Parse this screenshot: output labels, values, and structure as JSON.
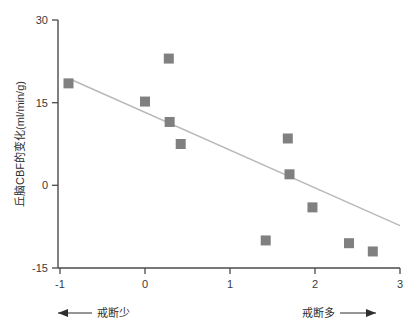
{
  "chart_data": {
    "type": "scatter",
    "title": "",
    "xlabel": "",
    "ylabel": "丘脑CBF的变化(ml/min/g)",
    "xlim": [
      -1,
      3
    ],
    "ylim": [
      -15,
      30
    ],
    "xticks": [
      "-1",
      "0",
      "1",
      "2",
      "3"
    ],
    "xtick_values": [
      -1,
      0,
      1,
      2,
      3
    ],
    "yticks": [
      "30",
      "15",
      "0",
      "-15"
    ],
    "ytick_values": [
      30,
      15,
      0,
      -15
    ],
    "grid": false,
    "legend": "none",
    "marker_shape": "square",
    "marker_color": "#808080",
    "series": [
      {
        "name": "丘脑CBF的变化",
        "points": [
          {
            "x": -0.9,
            "y": 18.5
          },
          {
            "x": 0.0,
            "y": 15.2
          },
          {
            "x": 0.28,
            "y": 23.0
          },
          {
            "x": 0.29,
            "y": 11.5
          },
          {
            "x": 0.42,
            "y": 7.5
          },
          {
            "x": 1.42,
            "y": -10.0
          },
          {
            "x": 1.68,
            "y": 8.5
          },
          {
            "x": 1.7,
            "y": 2.0
          },
          {
            "x": 1.97,
            "y": -4.0
          },
          {
            "x": 2.4,
            "y": -10.5
          },
          {
            "x": 2.68,
            "y": -12.0
          }
        ]
      }
    ],
    "trend_line": {
      "name": "回归线",
      "color": "#b9b9b9",
      "x0": -0.87,
      "y0": 19.2,
      "x1": 3.0,
      "y1": -7.3
    },
    "annotations": {
      "left": "戒断少",
      "right": "戒断多"
    }
  },
  "axes": {
    "y_title": "丘脑CBF的变化(ml/min/g)"
  }
}
